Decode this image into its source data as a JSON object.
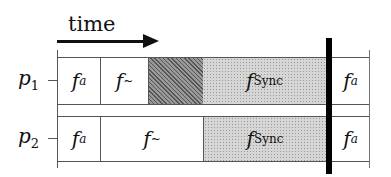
{
  "title": "time",
  "processes": [
    {
      "label": "p",
      "subscript": "1",
      "segments": [
        {
          "fn": "f",
          "sub": "a",
          "style": "plain"
        },
        {
          "fn": "f",
          "sub": "~",
          "style": "plain"
        },
        {
          "fn": "",
          "sub": "",
          "style": "hatched"
        },
        {
          "fn": "f",
          "sub": "Sync",
          "style": "dotted"
        },
        {
          "fn": "f",
          "sub": "a",
          "style": "plain"
        }
      ]
    },
    {
      "label": "p",
      "subscript": "2",
      "segments": [
        {
          "fn": "f",
          "sub": "a",
          "style": "plain"
        },
        {
          "fn": "f",
          "sub": "~",
          "style": "plain"
        },
        {
          "fn": "f",
          "sub": "Sync",
          "style": "dotted"
        },
        {
          "fn": "f",
          "sub": "a",
          "style": "plain"
        }
      ]
    }
  ],
  "colors": {
    "line": "#555555",
    "barrier": "#000000",
    "hatch": "#777777",
    "dotted": "#d6d6d6"
  }
}
